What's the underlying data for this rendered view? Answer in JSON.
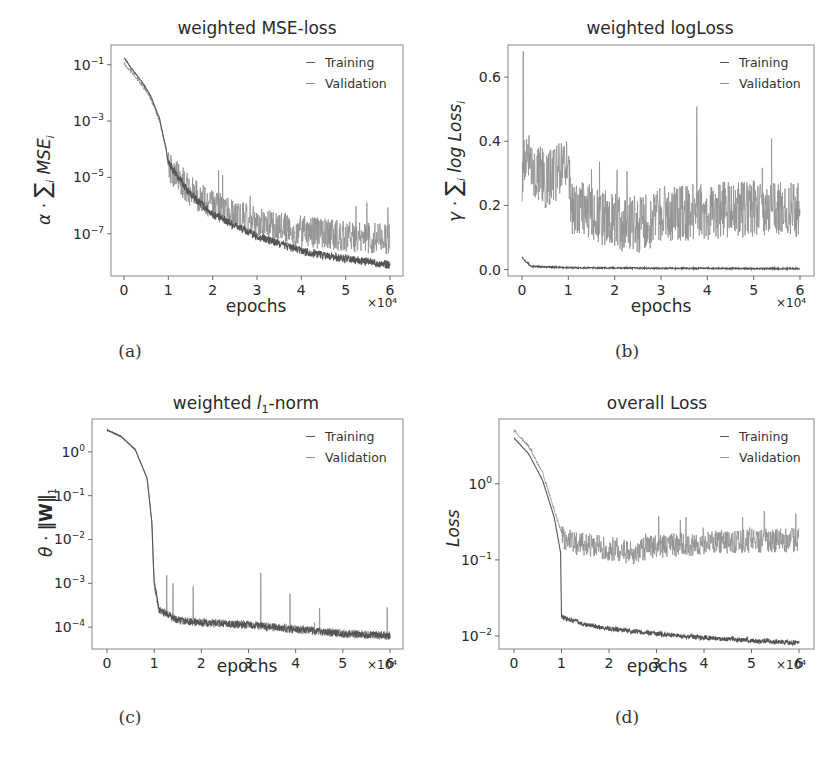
{
  "chart_data": [
    {
      "id": "a",
      "type": "line",
      "title": "weighted MSE-loss",
      "xlabel": "epochs",
      "x_multiplier": "×10⁴",
      "ylabel": "α · Σᵢ MSEᵢ",
      "yscale": "log",
      "xlim": [
        0,
        6
      ],
      "ylim_log10": [
        -8.5,
        -0.3
      ],
      "xticks": [
        0,
        1,
        2,
        3,
        4,
        5,
        6
      ],
      "yticks": [
        "10^-1",
        "10^-3",
        "10^-5",
        "10^-7"
      ],
      "ytick_values_log10": [
        -1,
        -3,
        -5,
        -7
      ],
      "legend": [
        "Training",
        "Validation"
      ],
      "legend_position": "upper right",
      "grid": false,
      "caption": "(a)",
      "series": [
        {
          "name": "Training",
          "x": [
            0,
            0.2,
            0.4,
            0.6,
            0.8,
            0.95,
            1.0,
            1.5,
            2,
            3,
            4,
            5,
            6
          ],
          "log10_values": [
            -0.75,
            -1.2,
            -1.6,
            -2.1,
            -2.9,
            -4.0,
            -4.5,
            -5.6,
            -6.3,
            -7.1,
            -7.6,
            -7.9,
            -8.1
          ],
          "noise": 0.15
        },
        {
          "name": "Validation",
          "x": [
            0,
            0.2,
            0.4,
            0.6,
            0.8,
            0.95,
            1.0,
            1.5,
            2,
            3,
            4,
            5,
            6
          ],
          "log10_values": [
            -0.95,
            -1.3,
            -1.7,
            -2.2,
            -3.0,
            -4.0,
            -4.6,
            -5.5,
            -6.0,
            -6.6,
            -6.9,
            -7.1,
            -7.2
          ],
          "noise": 0.55
        }
      ]
    },
    {
      "id": "b",
      "type": "line",
      "title": "weighted logLoss",
      "xlabel": "epochs",
      "x_multiplier": "×10⁴",
      "ylabel": "γ · Σᵢ log Lossᵢ",
      "yscale": "linear",
      "xlim": [
        0,
        6
      ],
      "ylim": [
        -0.02,
        0.7
      ],
      "xticks": [
        0,
        1,
        2,
        3,
        4,
        5,
        6
      ],
      "yticks": [
        "0.0",
        "0.2",
        "0.4",
        "0.6"
      ],
      "ytick_values": [
        0.0,
        0.2,
        0.4,
        0.6
      ],
      "legend": [
        "Training",
        "Validation"
      ],
      "legend_position": "upper right",
      "grid": false,
      "caption": "(b)",
      "series": [
        {
          "name": "Training",
          "x": [
            0,
            0.05,
            0.2,
            1,
            2,
            3,
            4,
            5,
            6
          ],
          "values": [
            0.04,
            0.03,
            0.01,
            0.006,
            0.005,
            0.004,
            0.004,
            0.003,
            0.003
          ],
          "noise": 0.002
        },
        {
          "name": "Validation",
          "x": [
            0,
            0.05,
            0.5,
            1.0,
            1.05,
            2,
            2.5,
            3,
            4,
            5,
            6
          ],
          "values": [
            0.3,
            0.35,
            0.28,
            0.33,
            0.2,
            0.15,
            0.14,
            0.17,
            0.18,
            0.19,
            0.19
          ],
          "noise": 0.09,
          "spike_max": 0.68
        }
      ]
    },
    {
      "id": "c",
      "type": "line",
      "title": "weighted l₁-norm",
      "xlabel": "epochs",
      "x_multiplier": "×10⁴",
      "ylabel": "θ · ‖W‖₁",
      "yscale": "log",
      "xlim": [
        0,
        6
      ],
      "ylim_log10": [
        -4.5,
        0.75
      ],
      "xticks": [
        0,
        1,
        2,
        3,
        4,
        5,
        6
      ],
      "yticks": [
        "10^0",
        "10^-1",
        "10^-2",
        "10^-3",
        "10^-4"
      ],
      "ytick_values_log10": [
        0,
        -1,
        -2,
        -3,
        -4
      ],
      "legend": [
        "Training",
        "Validation"
      ],
      "legend_position": "upper right",
      "grid": false,
      "caption": "(c)",
      "series": [
        {
          "name": "Training",
          "x": [
            0,
            0.3,
            0.6,
            0.85,
            0.95,
            1.0,
            1.1,
            1.5,
            2,
            3,
            4,
            5,
            6
          ],
          "log10_values": [
            0.5,
            0.35,
            0.05,
            -0.6,
            -1.6,
            -3.0,
            -3.6,
            -3.85,
            -3.9,
            -3.95,
            -4.05,
            -4.15,
            -4.2
          ],
          "noise": 0.08
        },
        {
          "name": "Validation",
          "x": [
            0,
            0.3,
            0.6,
            0.85,
            0.95,
            1.0,
            1.1,
            1.5,
            2,
            3,
            4,
            5,
            6
          ],
          "log10_values": [
            0.5,
            0.35,
            0.05,
            -0.6,
            -1.6,
            -3.0,
            -3.6,
            -3.85,
            -3.9,
            -3.95,
            -4.05,
            -4.15,
            -4.2
          ],
          "noise": 0.1,
          "spike_max_log10": -2.6
        }
      ]
    },
    {
      "id": "d",
      "type": "line",
      "title": "overall Loss",
      "xlabel": "epochs",
      "x_multiplier": "×10⁴",
      "ylabel": "Loss",
      "yscale": "log",
      "xlim": [
        0,
        6
      ],
      "ylim_log10": [
        -2.17,
        0.85
      ],
      "xticks": [
        0,
        1,
        2,
        3,
        4,
        5,
        6
      ],
      "yticks": [
        "10^0",
        "10^-1",
        "10^-2"
      ],
      "ytick_values_log10": [
        0,
        -1,
        -2
      ],
      "legend": [
        "Training",
        "Validation"
      ],
      "legend_position": "upper right",
      "grid": false,
      "caption": "(d)",
      "series": [
        {
          "name": "Training",
          "x": [
            0,
            0.3,
            0.6,
            0.85,
            0.98,
            1.0,
            1.5,
            2,
            3,
            4,
            5,
            6
          ],
          "log10_values": [
            0.6,
            0.4,
            0.05,
            -0.45,
            -0.9,
            -1.75,
            -1.85,
            -1.9,
            -1.97,
            -2.02,
            -2.06,
            -2.09
          ],
          "noise": 0.03
        },
        {
          "name": "Validation",
          "x": [
            0,
            0.3,
            0.6,
            0.85,
            0.98,
            1.05,
            1.5,
            2,
            2.5,
            3,
            4,
            5,
            6
          ],
          "log10_values": [
            0.7,
            0.5,
            0.15,
            -0.35,
            -0.6,
            -0.75,
            -0.8,
            -0.85,
            -0.9,
            -0.82,
            -0.78,
            -0.75,
            -0.74
          ],
          "noise": 0.16
        }
      ]
    }
  ],
  "panels": {
    "a": {
      "title": "weighted MSE-loss",
      "caption": "(a)",
      "xlabel": "epochs",
      "xexp": "×10⁴",
      "legend_training": "Training",
      "legend_validation": "Validation"
    },
    "b": {
      "title": "weighted logLoss",
      "caption": "(b)",
      "xlabel": "epochs",
      "xexp": "×10⁴",
      "legend_training": "Training",
      "legend_validation": "Validation"
    },
    "c": {
      "title": "weighted l₁-norm",
      "caption": "(c)",
      "xlabel": "epochs",
      "xexp": "×10⁴",
      "legend_training": "Training",
      "legend_validation": "Validation"
    },
    "d": {
      "title": "overall Loss",
      "caption": "(d)",
      "xlabel": "epochs",
      "xexp": "×10⁴",
      "legend_training": "Training",
      "legend_validation": "Validation"
    }
  },
  "colors": {
    "training": "#555555",
    "validation": "#8f8f8f",
    "frame": "#7a7a7a",
    "text": "#2a2a2a"
  }
}
